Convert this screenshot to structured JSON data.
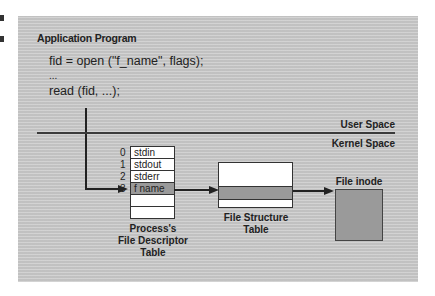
{
  "diagram": {
    "app_section": {
      "title": "Application Program",
      "code_lines": [
        "fid = open (\"f_name\", flags);",
        "...",
        "read (fid, ...);"
      ]
    },
    "boundary": {
      "user_label": "User Space",
      "kernel_label": "Kernel Space"
    },
    "fd_table": {
      "rows": [
        {
          "index": "0",
          "label": "stdin",
          "highlight": false
        },
        {
          "index": "1",
          "label": "stdout",
          "highlight": false
        },
        {
          "index": "2",
          "label": "stderr",
          "highlight": false
        },
        {
          "index": "3",
          "label": "f name",
          "highlight": true
        },
        {
          "index": "",
          "label": "",
          "highlight": false
        },
        {
          "index": "",
          "label": "",
          "highlight": false
        }
      ],
      "caption": [
        "Process's",
        "File Descriptor",
        "Table"
      ]
    },
    "file_structure_table": {
      "caption": [
        "File Structure",
        "Table"
      ]
    },
    "inode": {
      "label": "File inode"
    },
    "colors": {
      "panel": "#c9c9c9",
      "highlight": "#9a9a9a",
      "line": "#222222"
    }
  }
}
